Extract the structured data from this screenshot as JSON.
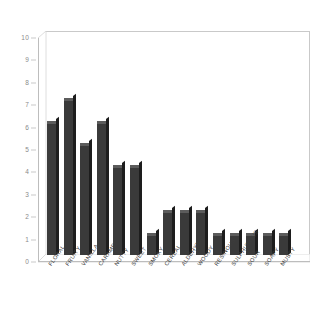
{
  "chart_data": {
    "type": "bar",
    "title": "",
    "subtitle": "",
    "xlabel": "",
    "ylabel": "",
    "ylim": [
      0,
      10
    ],
    "yticks": [
      0,
      1,
      2,
      3,
      4,
      5,
      6,
      7,
      8,
      9,
      10
    ],
    "ytick_labels": [
      "0",
      "1",
      "2",
      "3",
      "4",
      "5",
      "6",
      "7",
      "8",
      "9",
      "10"
    ],
    "grid": false,
    "legend": null,
    "style": "3d-bar",
    "bar_color": "#3a3a3a",
    "bar_top_color": "#5c5c5c",
    "bar_side_color": "#1d1d1d",
    "axis_color": "#bdbdbd",
    "tick_label_color": "#8a8a8a",
    "category_label_color": "#3d3d3d",
    "background_color": "#ffffff",
    "categories": [
      "FLORAL",
      "FRUITY",
      "VANILLA",
      "CARAMEL",
      "NUTTY",
      "SWEET",
      "SMOKY",
      "CEREAL",
      "ALDEHYDIC",
      "WOODY",
      "RESINOUS",
      "SULPHUROUS",
      "SOUR",
      "SOAPY",
      "MUSTY"
    ],
    "values": [
      6,
      7,
      5,
      6,
      4,
      4,
      1,
      2,
      2,
      2,
      1,
      1,
      1,
      1,
      1
    ]
  }
}
